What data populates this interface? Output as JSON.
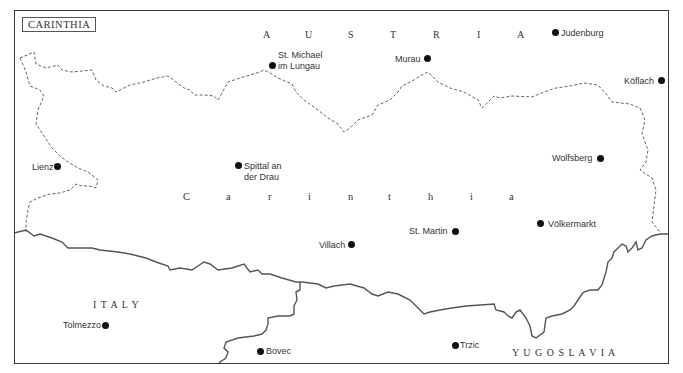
{
  "map": {
    "title": "CARINTHIA",
    "region_name_letters": [
      "C",
      "a",
      "r",
      "i",
      "n",
      "t",
      "h",
      "i",
      "a"
    ],
    "countries": {
      "austria_letters": [
        "A",
        "U",
        "S",
        "T",
        "R",
        "I",
        "A"
      ],
      "italy": "I T A L Y",
      "yugoslavia": "Y U G O S L A V I A"
    },
    "towns": [
      {
        "name": "Judenburg"
      },
      {
        "name": "St. Michael",
        "name2": "im Lungau"
      },
      {
        "name": "Murau"
      },
      {
        "name": "Köflach"
      },
      {
        "name": "Lienz"
      },
      {
        "name": "Spittal an",
        "name2": "der Drau"
      },
      {
        "name": "Wolfsberg"
      },
      {
        "name": "Völkermarkt"
      },
      {
        "name": "St. Martin"
      },
      {
        "name": "Villach"
      },
      {
        "name": "Tolmezzo"
      },
      {
        "name": "Bovec"
      },
      {
        "name": "Trzic"
      }
    ],
    "legend": {
      "dashed_line": "provincial boundary",
      "solid_line": "national boundary"
    },
    "colors": {
      "line": "#555555",
      "text": "#333333",
      "dot": "#111111"
    }
  }
}
